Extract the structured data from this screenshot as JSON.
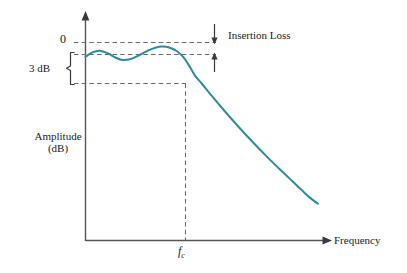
{
  "chart_data": {
    "type": "line",
    "title": "",
    "subtitle": "",
    "xlabel": "Frequency",
    "ylabel": "Amplitude (dB)",
    "ylabel_lines": [
      "Amplitude",
      "(dB)"
    ],
    "grid": false,
    "legend": null,
    "xlim": [
      0,
      1
    ],
    "ylim": [
      -12,
      1
    ],
    "axis_ticks": {
      "x": [],
      "y": []
    },
    "series": [
      {
        "name": "Filter response",
        "color": "#2e8b95",
        "x": [
          0.0,
          0.03,
          0.062,
          0.095,
          0.128,
          0.16,
          0.196,
          0.232,
          0.268,
          0.3,
          0.33,
          0.36,
          0.392,
          0.42,
          0.446,
          0.47,
          0.5,
          0.545,
          0.6,
          0.66,
          0.72,
          0.78,
          0.84,
          0.89,
          0.93,
          0.965,
          1.0
        ],
        "y": [
          -1.05,
          -0.72,
          -0.6,
          -0.78,
          -1.1,
          -1.28,
          -1.2,
          -0.92,
          -0.6,
          -0.38,
          -0.3,
          -0.36,
          -0.62,
          -1.05,
          -1.7,
          -2.4,
          -3.0,
          -3.95,
          -5.05,
          -6.2,
          -7.3,
          -8.35,
          -9.35,
          -10.15,
          -10.8,
          -11.35,
          -11.8
        ]
      }
    ],
    "reference_lines": [
      {
        "name": "zero-db-line",
        "label": "0",
        "value": 0,
        "style": "dashed",
        "orientation": "horizontal"
      },
      {
        "name": "ripple-peak-line",
        "label": "",
        "value": -0.3,
        "style": "dashed",
        "orientation": "horizontal"
      },
      {
        "name": "three-db-line",
        "label": "",
        "value": -3.0,
        "style": "dashed",
        "orientation": "horizontal"
      },
      {
        "name": "cutoff-line",
        "label": "fc",
        "value": 0.5,
        "style": "dashed",
        "orientation": "vertical"
      }
    ],
    "annotations": [
      {
        "name": "insertion-loss",
        "text": "Insertion Loss",
        "from_value": 0,
        "to_value": -0.3,
        "marker": "double-arrow"
      },
      {
        "name": "three-db-brace",
        "text": "3 dB",
        "from_value": -0.3,
        "to_value": -3.0,
        "marker": "brace"
      },
      {
        "name": "cutoff-frequency",
        "text": "fc",
        "text_main": "f",
        "text_sub": "c",
        "x_value": 0.5
      }
    ]
  },
  "labels": {
    "zero": "0",
    "three_db": "3 dB",
    "insertion_loss": "Insertion Loss",
    "amplitude_line1": "Amplitude",
    "amplitude_line2": "(dB)",
    "frequency": "Frequency",
    "fc_main": "f",
    "fc_sub": "c"
  },
  "colors": {
    "curve": "#2e8b95",
    "axis": "#555555",
    "dashed": "#6b6b6b",
    "text": "#1a1a1a",
    "background": "#ffffff"
  }
}
